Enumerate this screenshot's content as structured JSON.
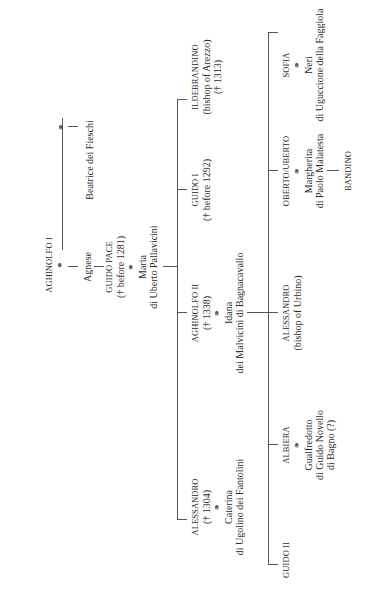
{
  "diagram": {
    "type": "family-tree",
    "orientation": "rotated-90-ccw",
    "marriage_symbol": "⚭",
    "generation_1": {
      "head": {
        "name": "AGHINOLFO I"
      },
      "spouses": [
        {
          "name": "Agnese"
        },
        {
          "name": "Beatrice dei Fieschi"
        }
      ]
    },
    "generation_2": {
      "person": {
        "name": "GUIDO PACE",
        "dates": "(† before 1281)"
      },
      "spouse": {
        "name": "Maria",
        "origin": "di Uberto Pallavicini"
      }
    },
    "generation_3": [
      {
        "name": "ALESSANDRO",
        "dates": "(† 1304)",
        "spouse": "Caterina",
        "spouse_origin": "di Ugolino dei Fantolini"
      },
      {
        "name": "AGHINOLFO II",
        "dates": "(† 1338)",
        "spouse": "Idana",
        "spouse_origin": "dei Malvicini di Bagnacavallo"
      },
      {
        "name": "GUIDO I",
        "dates": "(† before 1292)"
      },
      {
        "name": "ILDEBRANDINO",
        "title": "(bishop of Arezzo)",
        "dates": "(† 1313)"
      }
    ],
    "generation_4": [
      {
        "name": "GUIDO II"
      },
      {
        "name": "ALBIERA",
        "spouse": "Gualfredotto",
        "spouse_origin": "di Guido Novello",
        "spouse_origin2": "di Bagno (?)"
      },
      {
        "name": "ALESSANDRO",
        "title": "(bishop of Urbino)"
      },
      {
        "name": "OBERTO/UBERTO",
        "spouse": "Margherita",
        "spouse_origin": "di Paolo Malatesta",
        "child": "BANDINO"
      },
      {
        "name": "SOFIA",
        "spouse": "Neri",
        "spouse_origin": "di Uguccione della Faggiola"
      }
    ]
  }
}
